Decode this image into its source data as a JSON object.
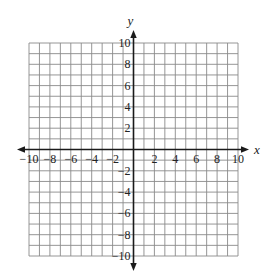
{
  "chart_data": {
    "type": "coordinate-grid",
    "title": "",
    "xlabel": "x",
    "ylabel": "y",
    "xlim": [
      -10,
      10
    ],
    "ylim": [
      -10,
      10
    ],
    "grid": true,
    "grid_step": 1,
    "x_tick_labels": [
      "-10",
      "-8",
      "-6",
      "-4",
      "-2",
      "2",
      "4",
      "6",
      "8",
      "10"
    ],
    "x_tick_values": [
      -10,
      -8,
      -6,
      -4,
      -2,
      2,
      4,
      6,
      8,
      10
    ],
    "y_tick_labels": [
      "10",
      "8",
      "6",
      "4",
      "2",
      "-2",
      "-4",
      "-6",
      "-8",
      "-10"
    ],
    "y_tick_values": [
      10,
      8,
      6,
      4,
      2,
      -2,
      -4,
      -6,
      -8,
      -10
    ],
    "series": []
  },
  "colors": {
    "grid": "#8a8a8a",
    "axis": "#1a1a1a",
    "text": "#222222",
    "background": "#ffffff"
  },
  "layout": {
    "grid_left": 29,
    "grid_right": 238,
    "grid_top": 43,
    "grid_bottom": 256,
    "origin_x": 133.5,
    "origin_y": 149,
    "x_axis_start": 17,
    "x_axis_end": 249,
    "y_axis_start": 30,
    "y_axis_end": 271
  }
}
